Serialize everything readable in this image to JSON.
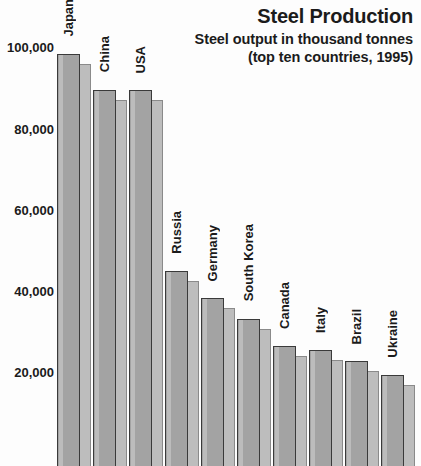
{
  "title": {
    "main": "Steel Production",
    "sub1": "Steel output in thousand tonnes",
    "sub2": "(top ten countries, 1995)"
  },
  "chart_data": {
    "type": "bar",
    "title": "Steel Production",
    "subtitle": "Steel output in thousand tonnes (top ten countries, 1995)",
    "xlabel": "",
    "ylabel": "Steel output in thousand tonnes",
    "ylim": [
      0,
      105000
    ],
    "grid": false,
    "legend": null,
    "y_ticks": [
      20000,
      40000,
      60000,
      80000,
      100000
    ],
    "y_tick_labels": [
      "20,000",
      "40,000",
      "60,000",
      "80,000",
      "100,000"
    ],
    "categories": [
      "Japan",
      "China",
      "USA",
      "Russia",
      "Germany",
      "South Korea",
      "Canada",
      "Italy",
      "Brazil",
      "Ukraine"
    ],
    "values": [
      101600,
      92800,
      92600,
      48100,
      41400,
      36300,
      29600,
      28600,
      25900,
      22400
    ],
    "series": [
      {
        "name": "Steel output",
        "values": [
          101600,
          92800,
          92600,
          48100,
          41400,
          36300,
          29600,
          28600,
          25900,
          22400
        ]
      }
    ],
    "colors": {
      "bar_face": "#a3a3a3",
      "bar_shadow": "#bdbdbd",
      "bar_outline": "#3a3a3a",
      "text": "#1b1b1b",
      "background": "#fdfdfd"
    }
  }
}
